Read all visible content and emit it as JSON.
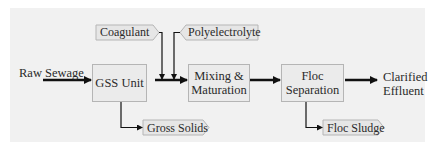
{
  "diagram": {
    "title": "",
    "colors": {
      "panel_bg": "#f1f1f1",
      "box_fill": "#ebebeb",
      "box_border": "#b5b5b5",
      "tag_fill": "#e6e6e6",
      "arrow": "#111111"
    },
    "input": {
      "label": "Raw Sewage"
    },
    "output": {
      "line1": "Clarified",
      "line2": "Effluent"
    },
    "process_boxes": [
      {
        "id": "gss",
        "line1": "GSS Unit",
        "line2": ""
      },
      {
        "id": "mixing",
        "line1": "Mixing &",
        "line2": "Maturation"
      },
      {
        "id": "floc-sep",
        "line1": "Floc",
        "line2": "Separation"
      }
    ],
    "additives": [
      {
        "id": "coagulant",
        "label": "Coagulant"
      },
      {
        "id": "polyelectrolyte",
        "label": "Polyelectrolyte"
      }
    ],
    "byproducts": [
      {
        "id": "gross-solids",
        "label": "Gross Solids",
        "from": "GSS Unit"
      },
      {
        "id": "floc-sludge",
        "label": "Floc Sludge",
        "from": "Floc Separation"
      }
    ],
    "edges": [
      {
        "from": "Raw Sewage",
        "to": "GSS Unit"
      },
      {
        "from": "GSS Unit",
        "to": "Mixing & Maturation"
      },
      {
        "from": "Coagulant",
        "to": "GSS Unit → Mixing line"
      },
      {
        "from": "Polyelectrolyte",
        "to": "GSS Unit → Mixing line"
      },
      {
        "from": "Mixing & Maturation",
        "to": "Floc Separation"
      },
      {
        "from": "Floc Separation",
        "to": "Clarified Effluent"
      },
      {
        "from": "GSS Unit",
        "to": "Gross Solids"
      },
      {
        "from": "Floc Separation",
        "to": "Floc Sludge"
      }
    ]
  }
}
